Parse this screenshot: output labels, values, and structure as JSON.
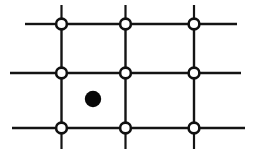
{
  "figure": {
    "type": "line-diagram",
    "background_color": "#ffffff",
    "ink_color": "#141414",
    "width": 260,
    "height": 156
  },
  "chart_data": {
    "type": "scatter",
    "xlabel": "",
    "ylabel": "",
    "xlim": [
      0,
      260
    ],
    "ylim": [
      0,
      156
    ],
    "grid": true,
    "legend": "none",
    "node_style": {
      "shape": "open-circle",
      "radius": 5.4,
      "stroke_width": 2.6,
      "fill": "#ffffff",
      "stroke": "#101010"
    },
    "marker_style": {
      "shape": "filled-circle",
      "radius": 8.2,
      "fill": "#080808"
    },
    "columns_x": [
      61.5,
      125.5,
      194.0
    ],
    "rows_y": [
      24.0,
      73.0,
      128.0
    ],
    "nodes": [
      {
        "name": "node-r1-c1",
        "x": 61.5,
        "y": 24.0
      },
      {
        "name": "node-r1-c2",
        "x": 125.5,
        "y": 24.0
      },
      {
        "name": "node-r1-c3",
        "x": 194.0,
        "y": 24.0
      },
      {
        "name": "node-r2-c1",
        "x": 61.5,
        "y": 73.0
      },
      {
        "name": "node-r2-c2",
        "x": 125.5,
        "y": 73.0
      },
      {
        "name": "node-r2-c3",
        "x": 194.0,
        "y": 73.0
      },
      {
        "name": "node-r3-c1",
        "x": 61.5,
        "y": 128.0
      },
      {
        "name": "node-r3-c2",
        "x": 125.5,
        "y": 128.0
      },
      {
        "name": "node-r3-c3",
        "x": 194.0,
        "y": 128.0
      }
    ],
    "marker_points": [
      {
        "name": "filled-dot",
        "x": 93.0,
        "y": 99.0
      }
    ],
    "horizontal_segments": [
      {
        "name": "h-r1-left-stub",
        "y": 24.0,
        "x1": 25.0,
        "x2": 55.5,
        "width": 2.4
      },
      {
        "name": "h-r1-c1-c2",
        "y": 24.0,
        "x1": 67.5,
        "x2": 119.5,
        "width": 2.4
      },
      {
        "name": "h-r1-c2-c3",
        "y": 24.0,
        "x1": 131.5,
        "x2": 188.0,
        "width": 2.4
      },
      {
        "name": "h-r1-right-stub",
        "y": 24.0,
        "x1": 200.0,
        "x2": 237.0,
        "width": 2.4
      },
      {
        "name": "h-r2-left-stub",
        "y": 73.0,
        "x1": 10.0,
        "x2": 55.5,
        "width": 2.6
      },
      {
        "name": "h-r2-c1-c2",
        "y": 73.0,
        "x1": 67.5,
        "x2": 119.5,
        "width": 2.6
      },
      {
        "name": "h-r2-c2-c3",
        "y": 73.0,
        "x1": 131.5,
        "x2": 188.0,
        "width": 2.6
      },
      {
        "name": "h-r2-right-stub",
        "y": 73.0,
        "x1": 200.0,
        "x2": 241.0,
        "width": 2.6
      },
      {
        "name": "h-r3-left-stub",
        "y": 128.0,
        "x1": 12.0,
        "x2": 55.5,
        "width": 2.6
      },
      {
        "name": "h-r3-c1-c2",
        "y": 128.0,
        "x1": 67.5,
        "x2": 119.5,
        "width": 2.6
      },
      {
        "name": "h-r3-c2-c3",
        "y": 128.0,
        "x1": 131.5,
        "x2": 188.0,
        "width": 2.6
      },
      {
        "name": "h-r3-right-stub",
        "y": 128.0,
        "x1": 200.0,
        "x2": 245.0,
        "width": 2.6
      }
    ],
    "vertical_segments": [
      {
        "name": "v-c1-top-stub",
        "x": 61.5,
        "y1": 5.0,
        "y2": 18.0,
        "width": 2.2
      },
      {
        "name": "v-c1-r1-r2",
        "x": 61.5,
        "y1": 30.0,
        "y2": 67.5,
        "width": 2.4
      },
      {
        "name": "v-c1-r2-r3",
        "x": 61.5,
        "y1": 79.0,
        "y2": 122.5,
        "width": 2.4
      },
      {
        "name": "v-c1-bottom-stub",
        "x": 61.5,
        "y1": 134.0,
        "y2": 149.0,
        "width": 2.2
      },
      {
        "name": "v-c2-top-stub",
        "x": 125.5,
        "y1": 5.0,
        "y2": 18.0,
        "width": 2.2
      },
      {
        "name": "v-c2-r1-r2",
        "x": 125.5,
        "y1": 30.0,
        "y2": 67.5,
        "width": 2.4
      },
      {
        "name": "v-c2-r2-r3",
        "x": 125.5,
        "y1": 79.0,
        "y2": 122.5,
        "width": 2.4
      },
      {
        "name": "v-c2-bottom-stub",
        "x": 125.5,
        "y1": 134.0,
        "y2": 149.0,
        "width": 2.2
      },
      {
        "name": "v-c3-top-stub",
        "x": 194.0,
        "y1": 5.0,
        "y2": 18.0,
        "width": 2.2
      },
      {
        "name": "v-c3-r1-r2",
        "x": 194.0,
        "y1": 30.0,
        "y2": 67.5,
        "width": 2.4
      },
      {
        "name": "v-c3-r2-r3",
        "x": 194.0,
        "y1": 79.0,
        "y2": 122.5,
        "width": 2.4
      },
      {
        "name": "v-c3-bottom-stub",
        "x": 194.0,
        "y1": 134.0,
        "y2": 149.0,
        "width": 2.2
      }
    ]
  }
}
